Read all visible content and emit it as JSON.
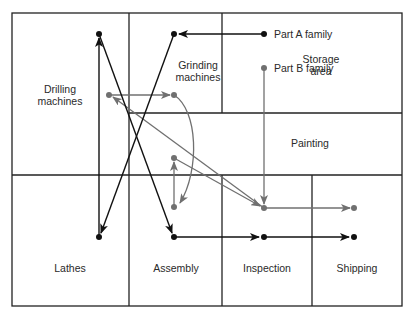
{
  "diagram": {
    "type": "facility-layout-flow",
    "areas": [
      {
        "id": "drilling",
        "label_line1": "Drilling",
        "label_line2": "machines"
      },
      {
        "id": "grinding",
        "label_line1": "Grinding",
        "label_line2": "machines"
      },
      {
        "id": "storage",
        "label_line1": "Storage",
        "label_line2": "area"
      },
      {
        "id": "painting",
        "label": "Painting"
      },
      {
        "id": "lathes",
        "label": "Lathes"
      },
      {
        "id": "assembly",
        "label": "Assembly"
      },
      {
        "id": "inspection",
        "label": "Inspection"
      },
      {
        "id": "shipping",
        "label": "Shipping"
      }
    ],
    "legend": {
      "part_a": "Part A family",
      "part_b": "Part B family"
    },
    "colors": {
      "part_a_flow": "#111111",
      "part_b_flow": "#707070",
      "walls": "#222222",
      "background": "#ffffff"
    },
    "flows": {
      "part_a": [
        "Storage area",
        "Grinding machines",
        "Lathes",
        "Drilling machines",
        "Assembly",
        "Inspection",
        "Shipping"
      ],
      "part_b": [
        "Storage area",
        "Inspection",
        "Drilling machines",
        "Grinding machines",
        "Painting",
        "Painting",
        "Inspection",
        "Shipping"
      ]
    }
  }
}
